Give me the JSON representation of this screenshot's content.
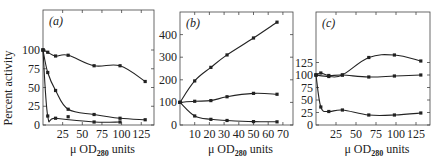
{
  "chart_data": [
    {
      "type": "line",
      "panel_label": "(a)",
      "title": "",
      "xlabel": "μ OD280 units",
      "ylabel": "Percent activity",
      "xlim": [
        0,
        140
      ],
      "ylim": [
        0,
        100
      ],
      "xticks": [
        25,
        50,
        75,
        100,
        125
      ],
      "yticks": [
        0,
        25,
        50,
        75,
        100
      ],
      "grid": false,
      "series": [
        {
          "name": "upper",
          "x": [
            0,
            6,
            16,
            32,
            65,
            98,
            130
          ],
          "y": [
            100,
            97,
            92,
            93,
            79,
            79,
            58
          ]
        },
        {
          "name": "middle",
          "x": [
            0,
            6,
            16,
            32,
            32,
            65,
            98,
            130
          ],
          "y": [
            100,
            70,
            46,
            21,
            11,
            14,
            9,
            7
          ]
        },
        {
          "name": "lower",
          "x": [
            0,
            6,
            16,
            65,
            98
          ],
          "y": [
            100,
            12,
            9,
            4,
            4
          ]
        }
      ]
    },
    {
      "type": "line",
      "panel_label": "(b)",
      "title": "",
      "xlabel": "μ OD280 units",
      "ylabel": "",
      "xlim": [
        0,
        76
      ],
      "ylim": [
        0,
        500
      ],
      "xticks": [
        10,
        20,
        30,
        40,
        50,
        60,
        70
      ],
      "yticks": [
        0,
        100,
        200,
        300,
        400
      ],
      "grid": false,
      "series": [
        {
          "name": "upper",
          "x": [
            0,
            10,
            21,
            32,
            50,
            66
          ],
          "y": [
            100,
            195,
            255,
            310,
            385,
            455
          ]
        },
        {
          "name": "middle",
          "x": [
            0,
            10,
            21,
            32,
            50,
            66
          ],
          "y": [
            100,
            105,
            108,
            125,
            140,
            136
          ]
        },
        {
          "name": "lower",
          "x": [
            0,
            10,
            21,
            32,
            50,
            66
          ],
          "y": [
            100,
            40,
            25,
            20,
            15,
            14
          ]
        }
      ]
    },
    {
      "type": "line",
      "panel_label": "(c)",
      "title": "",
      "xlabel": "μ OD280 units",
      "ylabel": "",
      "xlim": [
        0,
        145
      ],
      "ylim": [
        0,
        150
      ],
      "xticks": [
        25,
        50,
        75,
        100,
        125
      ],
      "yticks": [
        0,
        25,
        50,
        75,
        100,
        125
      ],
      "grid": false,
      "series": [
        {
          "name": "upper",
          "x": [
            0,
            16,
            33,
            66,
            98,
            131
          ],
          "y": [
            100,
            97,
            100,
            135,
            140,
            128
          ]
        },
        {
          "name": "flat",
          "x": [
            0,
            6,
            16,
            33,
            66,
            98,
            131
          ],
          "y": [
            100,
            104,
            99,
            100,
            96,
            98,
            100
          ]
        },
        {
          "name": "lower",
          "x": [
            0,
            6,
            16,
            33,
            66,
            98,
            131
          ],
          "y": [
            100,
            36,
            27,
            30,
            20,
            20,
            24
          ]
        }
      ]
    }
  ],
  "labels": {
    "ylabel": "Percent activity",
    "xlabel_main": "μ OD",
    "xlabel_sub": "280",
    "xlabel_tail": " units",
    "panel_a": "(a)",
    "panel_b": "(b)",
    "panel_c": "(c)"
  }
}
